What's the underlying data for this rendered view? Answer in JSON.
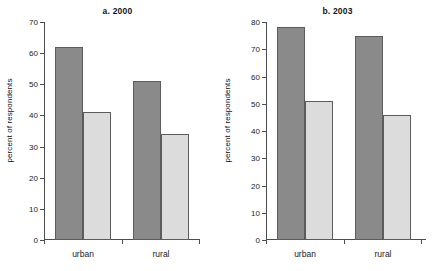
{
  "chart_data": [
    {
      "type": "bar",
      "id": "panel-a",
      "title": "a. 2000",
      "xlabel": "",
      "ylabel": "percent of respondents",
      "categories": [
        "urban",
        "rural"
      ],
      "ylim": [
        0,
        70
      ],
      "yticks": [
        0,
        10,
        20,
        30,
        40,
        50,
        60,
        70
      ],
      "grid": false,
      "legend": "none",
      "series": [
        {
          "name": "series-1",
          "color": "#8a8a8a",
          "values": [
            62,
            51
          ]
        },
        {
          "name": "series-2",
          "color": "#dcdcdc",
          "values": [
            41,
            34
          ]
        }
      ]
    },
    {
      "type": "bar",
      "id": "panel-b",
      "title": "b. 2003",
      "xlabel": "",
      "ylabel": "percent of respondents",
      "categories": [
        "urban",
        "rural"
      ],
      "ylim": [
        0,
        80
      ],
      "yticks": [
        0,
        10,
        20,
        30,
        40,
        50,
        60,
        70,
        80
      ],
      "grid": false,
      "legend": "none",
      "series": [
        {
          "name": "series-1",
          "color": "#8a8a8a",
          "values": [
            78,
            75
          ]
        },
        {
          "name": "series-2",
          "color": "#dcdcdc",
          "values": [
            51,
            46
          ]
        }
      ]
    }
  ],
  "colors": {
    "background": "#ffffff",
    "axis": "#4d4d4d",
    "text": "#1a1a1a",
    "bar_dark": "#8a8a8a",
    "bar_light": "#dcdcdc",
    "bar_outline": "#5c5c5c"
  }
}
